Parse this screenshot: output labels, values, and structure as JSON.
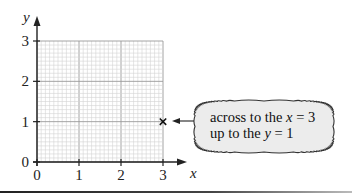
{
  "chart_data": {
    "type": "scatter",
    "title": "",
    "xlabel": "x",
    "ylabel": "y",
    "xlim": [
      0,
      3
    ],
    "ylim": [
      0,
      3
    ],
    "x_ticks": [
      "0",
      "1",
      "2",
      "3"
    ],
    "y_ticks": [
      "0",
      "1",
      "2",
      "3"
    ],
    "grid": true,
    "grid_minor_divisions_per_unit": 10,
    "points": [
      {
        "x": 3,
        "y": 1,
        "marker": "cross"
      }
    ],
    "annotation": {
      "line1_prefix": "across to the ",
      "line1_var": "x",
      "line1_suffix": " = 3",
      "line2_prefix": "up to the ",
      "line2_var": "y",
      "line2_suffix": " = 1",
      "arrow_points_to": {
        "x": 3,
        "y": 1
      }
    }
  },
  "colors": {
    "axis": "#222222",
    "grid_minor": "#d4d4d4",
    "grid_major": "#9a9a9a",
    "bubble_fill": "#ececec",
    "bubble_stroke": "#333333"
  }
}
